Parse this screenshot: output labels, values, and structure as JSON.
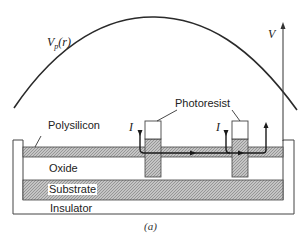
{
  "figure": {
    "caption": "(a)",
    "curve_label": "V_p(r)",
    "curve_label_main": "V",
    "curve_label_sub": "p",
    "curve_label_arg": "(r)",
    "axis_label": "V",
    "current_label_left": "I",
    "current_label_right": "I",
    "layers": {
      "polysilicon": "Polysilicon",
      "photoresist": "Photoresist",
      "oxide": "Oxide",
      "substrate": "Substrate",
      "insulator": "Insulator"
    },
    "colors": {
      "line": "#2a2a2a",
      "hatch_fill": "#b8b8b8",
      "background": "#ffffff"
    }
  }
}
